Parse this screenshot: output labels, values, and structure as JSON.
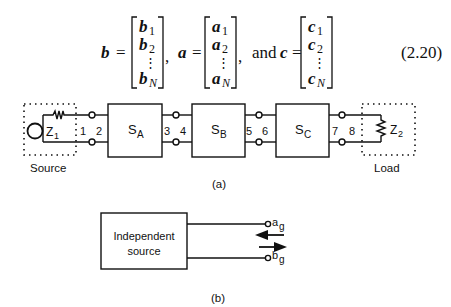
{
  "equation": {
    "lhs_b": "b",
    "lhs_a": "a",
    "lhs_c": "c",
    "equals": "=",
    "comma": ",",
    "and": "and",
    "number": "(2.20)",
    "vector_b": [
      "b",
      "b",
      "⋮",
      "b"
    ],
    "vector_b_subs": [
      "1",
      "2",
      "",
      "N"
    ],
    "vector_a": [
      "a",
      "a",
      "⋮",
      "a"
    ],
    "vector_a_subs": [
      "1",
      "2",
      "",
      "N"
    ],
    "vector_c": [
      "c",
      "c",
      "⋮",
      "c"
    ],
    "vector_c_subs": [
      "1",
      "2",
      "",
      "N"
    ]
  },
  "figure_a": {
    "caption": "(a)",
    "source_label": "Source",
    "load_label": "Load",
    "z1": "Z",
    "z1_sub": "1",
    "z2": "Z",
    "z2_sub": "2",
    "blocks": [
      {
        "name": "S",
        "sub": "A"
      },
      {
        "name": "S",
        "sub": "B"
      },
      {
        "name": "S",
        "sub": "C"
      }
    ],
    "ports": [
      "1",
      "2",
      "3",
      "4",
      "5",
      "6",
      "7",
      "8"
    ]
  },
  "figure_b": {
    "caption": "(b)",
    "box_line1": "Independent",
    "box_line2": "source",
    "port_a": "a",
    "port_a_sub": "g",
    "port_b": "b",
    "port_b_sub": "g"
  }
}
